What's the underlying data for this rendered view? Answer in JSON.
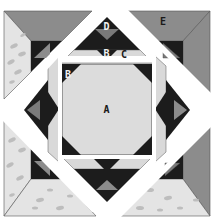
{
  "diagram": {
    "labels": {
      "a": "A",
      "b_left": "B",
      "b_top": "B",
      "c": "C",
      "d": "D",
      "e": "E"
    },
    "colors": {
      "background": "#ffffff",
      "light_fabric": "#d9d9d9",
      "center_fabric": "#dcdcdc",
      "dark_fabric": "#1c1c1c",
      "medium_grey": "#8c8c8c",
      "mid_triangle": "#7a7a7a",
      "speckled_fabric": "#e4e4e4",
      "speckle": "#b8b8b8",
      "sashing": "#ffffff",
      "outline": "#555555"
    }
  }
}
